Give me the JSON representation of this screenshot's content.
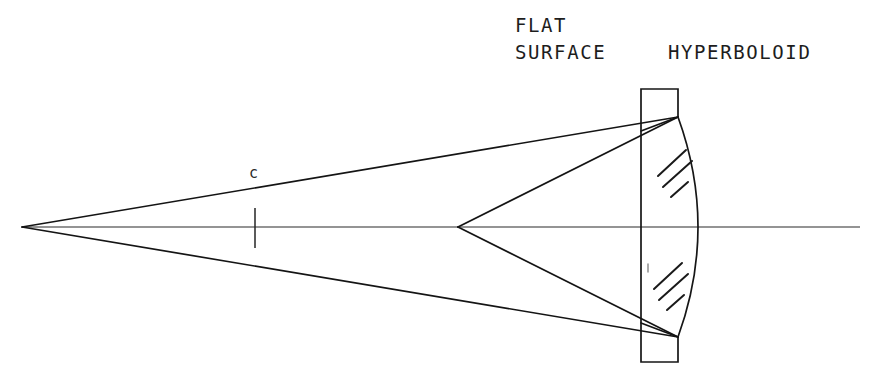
{
  "diagram": {
    "background_color": "#ffffff",
    "ink_color": "#161616",
    "labels": {
      "flat": "FLAT",
      "surface": "SURFACE",
      "hyperboloid": "HYPERBOLOID",
      "center_marker": "c"
    },
    "geometry": {
      "canvas": [
        875,
        382
      ],
      "optical_axis": {
        "x1": 22,
        "y1": 227,
        "x2": 860,
        "y2": 227
      },
      "left_focus": [
        22,
        227
      ],
      "mid_vertex": [
        458,
        227
      ],
      "lens_flat_face_x": 641,
      "lens_top_y": 89,
      "lens_bottom_y": 362,
      "lens_top_right": [
        678,
        117
      ],
      "lens_bottom_right": [
        678,
        337
      ],
      "lens_vertex_x": 698,
      "center_tick_x": 255
    },
    "rays": [
      {
        "name": "upper-outer-ray",
        "from": [
          22,
          227
        ],
        "to": [
          678,
          117
        ]
      },
      {
        "name": "lower-outer-ray",
        "from": [
          22,
          227
        ],
        "to": [
          678,
          337
        ]
      },
      {
        "name": "upper-inner-ray",
        "from": [
          458,
          227
        ],
        "to": [
          678,
          117
        ]
      },
      {
        "name": "lower-inner-ray",
        "from": [
          458,
          227
        ],
        "to": [
          678,
          337
        ]
      },
      {
        "name": "upper-return-ray",
        "from": [
          678,
          117
        ],
        "to": [
          641,
          130
        ]
      },
      {
        "name": "lower-return-ray",
        "from": [
          678,
          337
        ],
        "to": [
          641,
          324
        ]
      }
    ],
    "hatching": {
      "upper_group": [
        [
          658,
          176,
          686,
          150
        ],
        [
          663,
          186,
          692,
          160
        ],
        [
          671,
          196,
          688,
          181
        ]
      ],
      "lower_group": [
        [
          654,
          288,
          682,
          262
        ],
        [
          659,
          298,
          688,
          272
        ],
        [
          667,
          308,
          684,
          293
        ]
      ]
    },
    "label_positions": {
      "flat": [
        515,
        32
      ],
      "surface": [
        515,
        59
      ],
      "hyperboloid": [
        668,
        59
      ],
      "center_marker": [
        249,
        178
      ]
    }
  }
}
